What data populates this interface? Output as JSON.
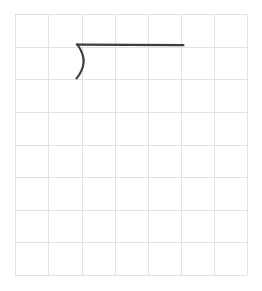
{
  "canvas": {
    "name": "grid-sketch-canvas",
    "width": 262,
    "height": 291,
    "background_color": "#ffffff"
  },
  "grid": {
    "name": "graph-paper-grid",
    "line_color": "#e2e2e4",
    "line_width": 1,
    "columns": 7,
    "rows": 8,
    "left": 15,
    "top": 14,
    "right": 247,
    "bottom": 275,
    "cell_width": 33.14,
    "cell_height": 32.63,
    "vertical_line_x": [
      15,
      48,
      82,
      115,
      148,
      181,
      214,
      247
    ],
    "horizontal_line_y": [
      14,
      47,
      79,
      112,
      145,
      177,
      210,
      242,
      275
    ]
  },
  "sketch": {
    "name": "hand-drawn-hook-stroke",
    "stroke_color": "#3d3d45",
    "stroke_width": 2.2,
    "description": "open paren curve joined to a long horizontal line",
    "strokes": [
      {
        "name": "curve-stroke",
        "type": "curve",
        "path": "M 77.5 44.5 C 81.5 50.5 84.2 56.5 83.6 62.5 C 83.0 68.5 80.4 73.8 76.6 78.4"
      },
      {
        "name": "horizontal-stroke",
        "type": "line",
        "path": "M 76.8 44.6 L 183.4 45.2"
      }
    ]
  }
}
